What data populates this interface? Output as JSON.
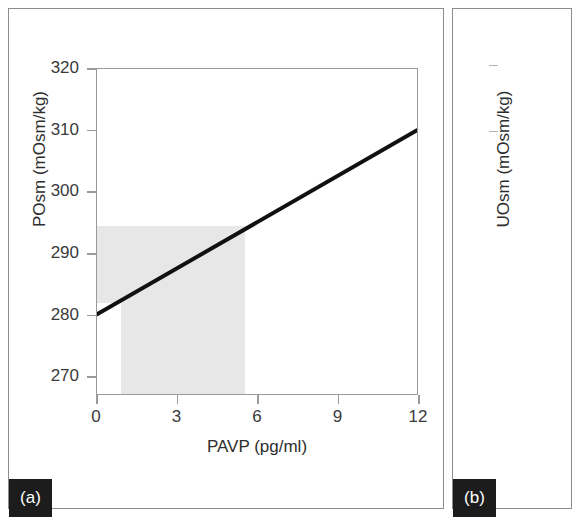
{
  "figure": {
    "background": "#ffffff",
    "panels": [
      {
        "id": "a",
        "badge_label": "(a)",
        "badge_bg": "#1c1c1c",
        "badge_fg": "#ffffff"
      },
      {
        "id": "b",
        "badge_label": "(b)",
        "badge_bg": "#1c1c1c",
        "badge_fg": "#ffffff"
      }
    ]
  },
  "chart_data": [
    {
      "panel": "a",
      "type": "line",
      "title": "",
      "xlabel": "PAVP (pg/ml)",
      "ylabel": "POsm (mOsm/kg)",
      "xlim": [
        0,
        12
      ],
      "ylim": [
        267,
        320
      ],
      "xticks": [
        0,
        3,
        6,
        9,
        12
      ],
      "xtick_labels": [
        "0",
        "3",
        "6",
        "9",
        "12"
      ],
      "yticks": [
        270,
        280,
        290,
        300,
        310,
        320
      ],
      "ytick_labels": [
        "270",
        "280",
        "290",
        "300",
        "310",
        "320"
      ],
      "grid": false,
      "legend": "none",
      "series": [
        {
          "name": "POsm vs PAVP regression",
          "color": "#111111",
          "line_width": 4,
          "x": [
            0,
            12
          ],
          "values": [
            280,
            310
          ]
        }
      ],
      "annotations": [
        {
          "name": "normal-posm-band",
          "type": "hspan",
          "color": "#e7e7e7",
          "y_range": [
            282,
            294.5
          ],
          "x_range": [
            0,
            5.5
          ]
        },
        {
          "name": "normal-pavp-band",
          "type": "vspan",
          "color": "#e7e7e7",
          "x_range": [
            0.9,
            5.5
          ],
          "y_range": [
            267,
            294.5
          ]
        }
      ]
    },
    {
      "panel": "b",
      "type": "line",
      "title": "",
      "xlabel": "",
      "ylabel": "UOsm (mOsm/kg)",
      "xticks": [],
      "yticks": [],
      "ytick_labels": [],
      "grid": false,
      "legend": "none",
      "series": [],
      "note": "panel clipped by right image edge"
    }
  ]
}
